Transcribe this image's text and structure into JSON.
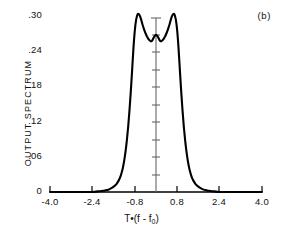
{
  "panel": {
    "tag": "(b)"
  },
  "chart_data": {
    "type": "line",
    "title": "",
    "subtitle": "",
    "panel_label": "(b)",
    "xlabel": "T•(f - f0)",
    "xlabel_parts": {
      "prefix": "T•(f - f",
      "sub": "0",
      "suffix": ")"
    },
    "ylabel": "OUTPUT  SPECTRUM",
    "xlim": [
      -4.0,
      4.0
    ],
    "ylim": [
      0,
      0.3
    ],
    "grid": false,
    "legend": null,
    "xticks": [
      -4.0,
      -2.4,
      -0.8,
      0.8,
      2.4,
      4.0
    ],
    "xticklabels": [
      "-4.0",
      "-2.4",
      "-0.8",
      "0.8",
      "2.4",
      "4.0"
    ],
    "yticks": [
      0,
      0.06,
      0.12,
      0.18,
      0.24,
      0.3
    ],
    "yticklabels": [
      "0",
      ".06",
      ".12",
      ".18",
      ".24",
      ".30"
    ],
    "minor_yticks_on_center_axis": 10,
    "series": [
      {
        "name": "output spectrum",
        "x": [
          -4.0,
          -3.6,
          -3.2,
          -2.8,
          -2.4,
          -2.2,
          -2.0,
          -1.9,
          -1.8,
          -1.7,
          -1.6,
          -1.5,
          -1.4,
          -1.35,
          -1.3,
          -1.25,
          -1.2,
          -1.15,
          -1.1,
          -1.05,
          -1.0,
          -0.95,
          -0.9,
          -0.85,
          -0.8,
          -0.75,
          -0.7,
          -0.65,
          -0.6,
          -0.55,
          -0.5,
          -0.45,
          -0.4,
          -0.35,
          -0.3,
          -0.25,
          -0.2,
          -0.15,
          -0.1,
          -0.05,
          0.0,
          0.05,
          0.1,
          0.15,
          0.2,
          0.25,
          0.3,
          0.35,
          0.4,
          0.45,
          0.5,
          0.55,
          0.6,
          0.65,
          0.7,
          0.75,
          0.8,
          0.85,
          0.9,
          0.95,
          1.0,
          1.05,
          1.1,
          1.15,
          1.2,
          1.25,
          1.3,
          1.35,
          1.4,
          1.5,
          1.6,
          1.7,
          1.8,
          1.9,
          2.0,
          2.2,
          2.4,
          2.8,
          3.2,
          3.6,
          4.0
        ],
        "y": [
          0.0,
          0.0,
          0.0,
          0.0,
          0.0,
          0.001,
          0.002,
          0.003,
          0.004,
          0.006,
          0.009,
          0.013,
          0.02,
          0.025,
          0.032,
          0.041,
          0.053,
          0.068,
          0.087,
          0.11,
          0.138,
          0.17,
          0.206,
          0.243,
          0.272,
          0.29,
          0.299,
          0.3,
          0.296,
          0.289,
          0.281,
          0.274,
          0.268,
          0.263,
          0.259,
          0.256,
          0.254,
          0.255,
          0.259,
          0.263,
          0.265,
          0.263,
          0.259,
          0.255,
          0.254,
          0.256,
          0.259,
          0.263,
          0.268,
          0.274,
          0.281,
          0.289,
          0.296,
          0.3,
          0.299,
          0.29,
          0.272,
          0.243,
          0.206,
          0.17,
          0.138,
          0.11,
          0.087,
          0.068,
          0.053,
          0.041,
          0.032,
          0.025,
          0.02,
          0.013,
          0.009,
          0.006,
          0.004,
          0.003,
          0.002,
          0.001,
          0.0,
          0.0,
          0.0,
          0.0,
          0.0
        ],
        "peaks": [
          {
            "x": -0.65,
            "y": 0.3
          },
          {
            "x": 0.65,
            "y": 0.3
          }
        ],
        "local_minima": [
          {
            "x": -0.2,
            "y": 0.254
          },
          {
            "x": 0.2,
            "y": 0.254
          }
        ],
        "center_local_max": {
          "x": 0.0,
          "y": 0.265
        }
      }
    ],
    "axes_style": {
      "bottom_spine": true,
      "left_spine": false,
      "center_vertical_axis": true,
      "center_axis_x": 0.0
    },
    "colors": {
      "curve": "#000000",
      "axis": "#000000",
      "center_axis": "#555555",
      "background": "#ffffff",
      "text": "#111111"
    }
  }
}
